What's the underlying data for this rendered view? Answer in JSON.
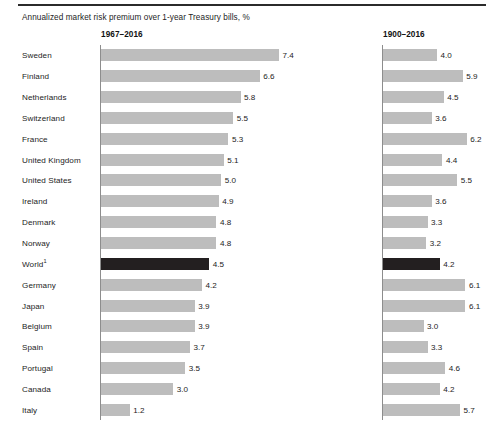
{
  "chart_data": {
    "type": "bar",
    "title": "Annualized market risk premium over 1-year Treasury bills, %",
    "xlabel": "",
    "ylabel": "",
    "orientation": "horizontal",
    "grid": false,
    "legend": "none",
    "xlim": [
      0,
      7.4
    ],
    "panels": [
      {
        "label": "1967–2016",
        "key": "p1967"
      },
      {
        "label": "1900–2016",
        "key": "p1900"
      }
    ],
    "categories": [
      "Sweden",
      "Finland",
      "Netherlands",
      "Switzerland",
      "France",
      "United Kingdom",
      "United States",
      "Ireland",
      "Denmark",
      "Norway",
      "World",
      "Germany",
      "Japan",
      "Belgium",
      "Spain",
      "Portugal",
      "Canada",
      "Italy"
    ],
    "series": [
      {
        "name": "1967–2016",
        "values": [
          7.4,
          6.6,
          5.8,
          5.5,
          5.3,
          5.1,
          5.0,
          4.9,
          4.8,
          4.8,
          4.5,
          4.2,
          3.9,
          3.9,
          3.7,
          3.5,
          3.0,
          1.2
        ]
      },
      {
        "name": "1900–2016",
        "values": [
          4.0,
          5.9,
          4.5,
          3.6,
          6.2,
          4.4,
          5.5,
          3.6,
          3.3,
          3.2,
          4.2,
          6.1,
          6.1,
          3.0,
          3.3,
          4.6,
          4.2,
          5.7
        ]
      }
    ],
    "highlight_category": "World",
    "highlight_footnote": "1",
    "colors": {
      "bar": "#bdbdbd",
      "highlight_bar": "#231f20",
      "text": "#1d1d1d",
      "axis": "#8d8d8d",
      "rule": "#2b2b2b",
      "background": "#ffffff"
    }
  },
  "rows": [
    {
      "label": "Sweden",
      "footnote": "",
      "highlight": false,
      "v1967": "7.4",
      "v1900": "4.0"
    },
    {
      "label": "Finland",
      "footnote": "",
      "highlight": false,
      "v1967": "6.6",
      "v1900": "5.9"
    },
    {
      "label": "Netherlands",
      "footnote": "",
      "highlight": false,
      "v1967": "5.8",
      "v1900": "4.5"
    },
    {
      "label": "Switzerland",
      "footnote": "",
      "highlight": false,
      "v1967": "5.5",
      "v1900": "3.6"
    },
    {
      "label": "France",
      "footnote": "",
      "highlight": false,
      "v1967": "5.3",
      "v1900": "6.2"
    },
    {
      "label": "United Kingdom",
      "footnote": "",
      "highlight": false,
      "v1967": "5.1",
      "v1900": "4.4"
    },
    {
      "label": "United States",
      "footnote": "",
      "highlight": false,
      "v1967": "5.0",
      "v1900": "5.5"
    },
    {
      "label": "Ireland",
      "footnote": "",
      "highlight": false,
      "v1967": "4.9",
      "v1900": "3.6"
    },
    {
      "label": "Denmark",
      "footnote": "",
      "highlight": false,
      "v1967": "4.8",
      "v1900": "3.3"
    },
    {
      "label": "Norway",
      "footnote": "",
      "highlight": false,
      "v1967": "4.8",
      "v1900": "3.2"
    },
    {
      "label": "World",
      "footnote": "1",
      "highlight": true,
      "v1967": "4.5",
      "v1900": "4.2"
    },
    {
      "label": "Germany",
      "footnote": "",
      "highlight": false,
      "v1967": "4.2",
      "v1900": "6.1"
    },
    {
      "label": "Japan",
      "footnote": "",
      "highlight": false,
      "v1967": "3.9",
      "v1900": "6.1"
    },
    {
      "label": "Belgium",
      "footnote": "",
      "highlight": false,
      "v1967": "3.9",
      "v1900": "3.0"
    },
    {
      "label": "Spain",
      "footnote": "",
      "highlight": false,
      "v1967": "3.7",
      "v1900": "3.3"
    },
    {
      "label": "Portugal",
      "footnote": "",
      "highlight": false,
      "v1967": "3.5",
      "v1900": "4.6"
    },
    {
      "label": "Canada",
      "footnote": "",
      "highlight": false,
      "v1967": "3.0",
      "v1900": "4.2"
    },
    {
      "label": "Italy",
      "footnote": "",
      "highlight": false,
      "v1967": "1.2",
      "v1900": "5.7"
    }
  ],
  "header": {
    "title": "Annualized market risk premium over 1-year Treasury bills, %",
    "panel_left": "1967–2016",
    "panel_right": "1900–2016"
  }
}
